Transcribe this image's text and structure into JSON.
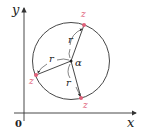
{
  "diagram": {
    "axes": {
      "x_label": "x",
      "y_label": "y",
      "origin_label": "0"
    },
    "circle": {
      "center_label": "α",
      "radius_label": "r"
    },
    "points": [
      {
        "label": "z",
        "position": "top"
      },
      {
        "label": "z",
        "position": "left"
      },
      {
        "label": "z",
        "position": "bottom"
      }
    ],
    "radii": [
      {
        "label": "r",
        "to": "top"
      },
      {
        "label": "r",
        "to": "left"
      },
      {
        "label": "r",
        "to": "bottom"
      }
    ],
    "colors": {
      "stroke": "#333333",
      "point": "#e0607a",
      "text": "#222222"
    }
  }
}
